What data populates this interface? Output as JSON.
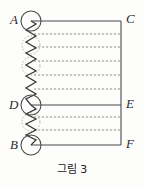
{
  "figure": {
    "caption": "그림 3",
    "caption_position": {
      "x": 0,
      "y": 163
    },
    "canvas": {
      "width": 144,
      "height": 189
    },
    "ink_color": "#4a4a4a",
    "spring_color": "#3a3a3a",
    "dash_color": "#8a8a8a",
    "label_color": "#2b2b2b",
    "background": "#fdfdfc",
    "labels": [
      {
        "id": "A",
        "text": "A",
        "x": 10,
        "y": 13,
        "anchor": "left-of-node"
      },
      {
        "id": "C",
        "text": "C",
        "x": 126,
        "y": 12,
        "anchor": "right-of-node"
      },
      {
        "id": "D",
        "text": "D",
        "x": 9,
        "y": 98,
        "anchor": "left-of-node"
      },
      {
        "id": "E",
        "text": "E",
        "x": 126,
        "y": 97,
        "anchor": "right-of-node"
      },
      {
        "id": "B",
        "text": "B",
        "x": 10,
        "y": 138,
        "anchor": "left-of-node"
      },
      {
        "id": "F",
        "text": "F",
        "x": 126,
        "y": 137,
        "anchor": "right-of-node"
      }
    ],
    "nodes": [
      {
        "id": "A",
        "cx": 31,
        "cy": 21,
        "r": 10,
        "style": "solid-circle"
      },
      {
        "id": "D",
        "cx": 31,
        "cy": 105,
        "r": 10,
        "style": "solid-circle"
      },
      {
        "id": "B",
        "cx": 31,
        "cy": 145,
        "r": 10,
        "style": "solid-circle"
      },
      {
        "id": "ghost-1",
        "cx": 31,
        "cy": 45,
        "r": 9,
        "style": "dotted-circle"
      },
      {
        "id": "ghost-2",
        "cx": 31,
        "cy": 66,
        "r": 9,
        "style": "dotted-circle"
      },
      {
        "id": "ghost-3",
        "cx": 31,
        "cy": 122,
        "r": 9,
        "style": "dotted-circle"
      }
    ],
    "solid_lines": [
      {
        "id": "AC",
        "x1": 31,
        "y1": 21,
        "x2": 121,
        "y2": 21
      },
      {
        "id": "DE",
        "x1": 31,
        "y1": 105,
        "x2": 121,
        "y2": 105
      },
      {
        "id": "BF",
        "x1": 31,
        "y1": 145,
        "x2": 121,
        "y2": 145
      },
      {
        "id": "right-rail",
        "x1": 121,
        "y1": 21,
        "x2": 121,
        "y2": 145
      }
    ],
    "dashed_lines": [
      {
        "id": "dash-1",
        "x1": 34,
        "y1": 34,
        "x2": 121,
        "y2": 34
      },
      {
        "id": "dash-2",
        "x1": 34,
        "y1": 47,
        "x2": 121,
        "y2": 47
      },
      {
        "id": "dash-3",
        "x1": 34,
        "y1": 61,
        "x2": 121,
        "y2": 61
      },
      {
        "id": "dash-4",
        "x1": 34,
        "y1": 75,
        "x2": 121,
        "y2": 75
      },
      {
        "id": "dash-5",
        "x1": 34,
        "y1": 89,
        "x2": 121,
        "y2": 89
      },
      {
        "id": "dash-6",
        "x1": 34,
        "y1": 117,
        "x2": 121,
        "y2": 117
      },
      {
        "id": "dash-7",
        "x1": 34,
        "y1": 130,
        "x2": 121,
        "y2": 130
      }
    ],
    "spring": {
      "id": "vertical-spring",
      "x_center": 31,
      "y_top": 21,
      "y_bottom": 145,
      "amplitude": 5,
      "coils": 22,
      "description": "zigzag spring drawn vertically from A through D to B"
    }
  }
}
